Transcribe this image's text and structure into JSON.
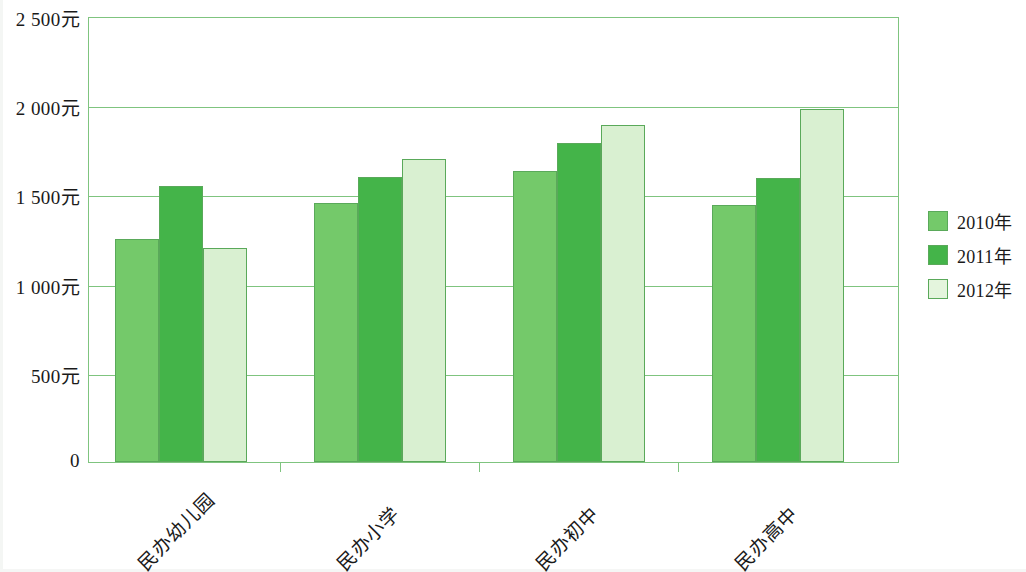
{
  "chart_data": {
    "type": "bar",
    "title": "",
    "subtitle": "",
    "xlabel": "",
    "ylabel": "",
    "categories": [
      "民办幼儿园",
      "民办小学",
      "民办初中",
      "民办高中"
    ],
    "series": [
      {
        "name": "2010年",
        "color": "#74c96a",
        "values": [
          1250,
          1450,
          1630,
          1440
        ]
      },
      {
        "name": "2011年",
        "color": "#44b449",
        "values": [
          1545,
          1600,
          1790,
          1590
        ]
      },
      {
        "name": "2012年",
        "color": "#d9f0d1",
        "values": [
          1200,
          1700,
          1890,
          1980
        ]
      }
    ],
    "ylim": [
      0,
      2500
    ],
    "ytick_values": [
      0,
      500,
      1000,
      1500,
      2000,
      2500
    ],
    "ytick_labels": [
      "0",
      "500元",
      "1 000元",
      "1 500元",
      "2 000元",
      "2 500元"
    ],
    "unit_suffix": "元",
    "grid": true,
    "legend_position": "right",
    "axis_color": "#7fc47f",
    "bar_border_color": "#5aa95a"
  },
  "legend": {
    "entries": [
      {
        "label": "2010年",
        "swatch": "series-1-swatch"
      },
      {
        "label": "2011年",
        "swatch": "series-2-swatch"
      },
      {
        "label": "2012年",
        "swatch": "series-3-swatch"
      }
    ]
  }
}
